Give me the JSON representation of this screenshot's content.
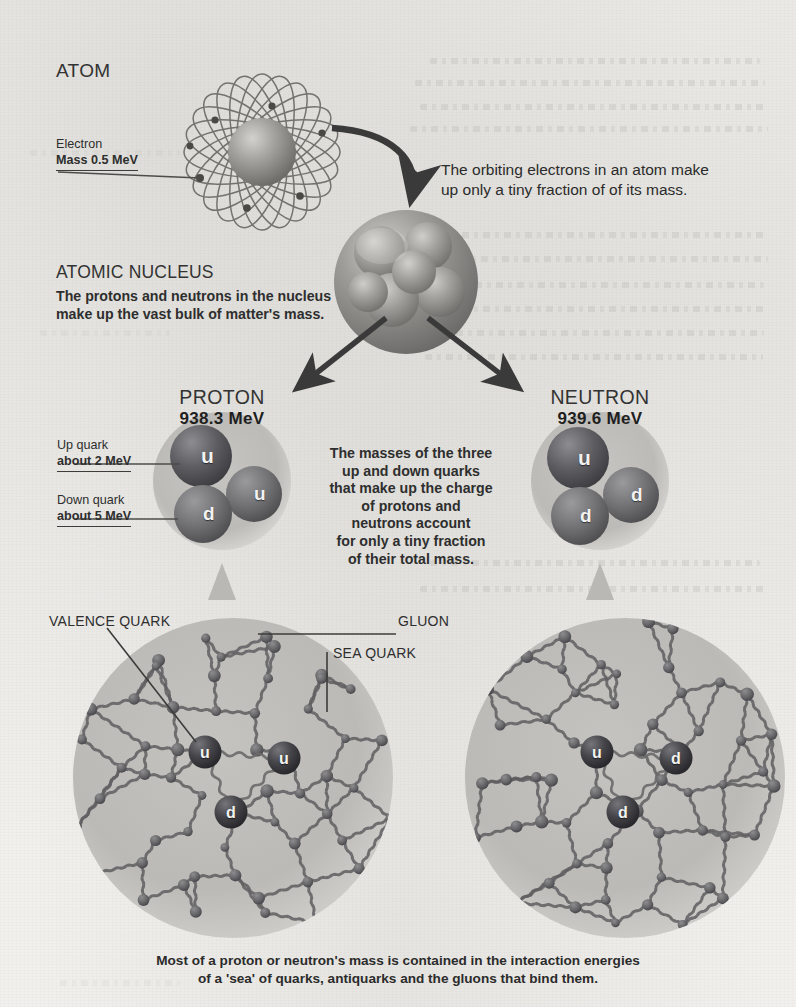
{
  "meta": {
    "canvas": {
      "width": 796,
      "height": 1007
    },
    "background_color": "#f1f0ed",
    "ink_color": "#2b2b2b"
  },
  "sections": {
    "atom": {
      "heading": "ATOM",
      "electron_label": "Electron",
      "electron_mass": "Mass 0.5 MeV"
    },
    "nucleus": {
      "heading": "ATOMIC NUCLEUS",
      "description": "The protons and neutrons in the nucleus\nmake up the vast bulk of matter's mass."
    },
    "electron_note": {
      "text": "The orbiting electrons in an atom make\nup only a tiny fraction of of its mass."
    },
    "proton": {
      "name": "PROTON",
      "mass": "938.3 MeV",
      "quarks": [
        "u",
        "u",
        "d"
      ]
    },
    "neutron": {
      "name": "NEUTRON",
      "mass": "939.6 MeV",
      "quarks": [
        "u",
        "d",
        "d"
      ]
    },
    "quark_tags": {
      "up_name": "Up quark",
      "up_mass": "about 2 MeV",
      "down_name": "Down quark",
      "down_mass": "about 5 MeV"
    },
    "center_note": {
      "text": "The masses of the three\nup and down quarks\nthat make up the charge\nof protons and\nneutrons account\nfor only a tiny fraction\nof their total mass."
    },
    "sea_labels": {
      "valence": "VALENCE QUARK",
      "gluon": "GLUON",
      "sea": "SEA QUARK"
    },
    "sea_proton": {
      "valence_quarks": [
        "u",
        "u",
        "d"
      ]
    },
    "sea_neutron": {
      "valence_quarks": [
        "u",
        "d",
        "d"
      ]
    },
    "bottom_caption": {
      "text": "Most of a proton or neutron's mass is contained in the interaction energies\nof a 'sea' of quarks, antiquarks and the gluons that bind them."
    }
  },
  "chart_data": {
    "type": "diagram",
    "levels": [
      {
        "level": 1,
        "name": "ATOM",
        "note": "The orbiting electrons in an atom make up only a tiny fraction of of its mass.",
        "components": [
          {
            "label": "Electron",
            "mass": "0.5 MeV"
          }
        ]
      },
      {
        "level": 2,
        "name": "ATOMIC NUCLEUS",
        "note": "The protons and neutrons in the nucleus make up the vast bulk of matter's mass.",
        "components": [
          {
            "label": "PROTON",
            "mass": "938.3 MeV"
          },
          {
            "label": "NEUTRON",
            "mass": "939.6 MeV"
          }
        ]
      },
      {
        "level": 3,
        "name": "VALENCE QUARKS",
        "note": "The masses of the three up and down quarks that make up the charge of protons and neutrons account for only a tiny fraction of their total mass.",
        "components": [
          {
            "label": "Up quark",
            "mass": "about 2 MeV"
          },
          {
            "label": "Down quark",
            "mass": "about 5 MeV"
          }
        ]
      },
      {
        "level": 4,
        "name": "QUARK-GLUON SEA",
        "note": "Most of a proton or neutron's mass is contained in the interaction energies of a 'sea' of quarks, antiquarks and the gluons that bind them.",
        "components": [
          {
            "label": "VALENCE QUARK"
          },
          {
            "label": "GLUON"
          },
          {
            "label": "SEA QUARK"
          }
        ]
      }
    ]
  },
  "colors": {
    "paper": "#f1f0ed",
    "ink": "#2b2b2b",
    "sphere_grey": "#9b9a96",
    "sphere_light": "#c9c8c4",
    "quark_dark": "#56555a",
    "quark_mid": "#6e6d70",
    "halo": "#bdbcb8"
  }
}
